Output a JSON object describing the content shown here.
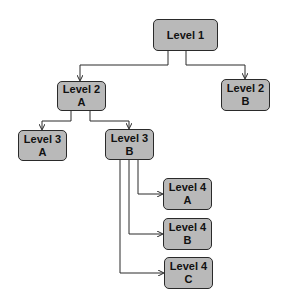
{
  "diagram": {
    "type": "tree",
    "colors": {
      "node_fill": "#b9b9b9",
      "node_border": "#2a2a2a",
      "edge": "#2a2a2a",
      "background": "#ffffff"
    },
    "nodes": {
      "l1": {
        "line1": "Level 1",
        "line2": ""
      },
      "l2a": {
        "line1": "Level 2",
        "line2": "A"
      },
      "l2b": {
        "line1": "Level 2",
        "line2": "B"
      },
      "l3a": {
        "line1": "Level 3",
        "line2": "A"
      },
      "l3b": {
        "line1": "Level 3",
        "line2": "B"
      },
      "l4a": {
        "line1": "Level 4",
        "line2": "A"
      },
      "l4b": {
        "line1": "Level 4",
        "line2": "B"
      },
      "l4c": {
        "line1": "Level 4",
        "line2": "C"
      }
    },
    "edges": [
      [
        "Level 1",
        "Level 2 A"
      ],
      [
        "Level 1",
        "Level 2 B"
      ],
      [
        "Level 2 A",
        "Level 3 A"
      ],
      [
        "Level 2 A",
        "Level 3 B"
      ],
      [
        "Level 3 B",
        "Level 4 A"
      ],
      [
        "Level 3 B",
        "Level 4 B"
      ],
      [
        "Level 3 B",
        "Level 4 C"
      ]
    ]
  }
}
